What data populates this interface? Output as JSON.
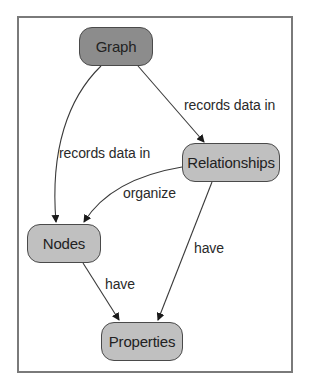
{
  "diagram": {
    "type": "concept-map",
    "colors": {
      "frame_border": "#7a7a7a",
      "root_node_fill": "#8c8c8c",
      "node_fill": "#c0c0c0",
      "node_border": "#4a4a4a",
      "edge_color": "#3a3a3a",
      "text_color": "#222222"
    },
    "nodes": [
      {
        "id": "graph",
        "label": "Graph"
      },
      {
        "id": "relationships",
        "label": "Relationships"
      },
      {
        "id": "nodes",
        "label": "Nodes"
      },
      {
        "id": "properties",
        "label": "Properties"
      }
    ],
    "edges": [
      {
        "from": "graph",
        "to": "relationships",
        "label": "records data in"
      },
      {
        "from": "graph",
        "to": "nodes",
        "label": "records data in"
      },
      {
        "from": "relationships",
        "to": "nodes",
        "label": "organize"
      },
      {
        "from": "relationships",
        "to": "properties",
        "label": "have"
      },
      {
        "from": "nodes",
        "to": "properties",
        "label": "have"
      }
    ]
  }
}
